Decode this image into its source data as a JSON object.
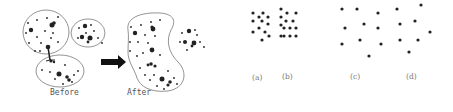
{
  "left_panel": {
    "before_label": "Before",
    "after_label": "After",
    "arrow": "right-arrow"
  },
  "right_panel": {
    "labels": [
      "(a)",
      "(b)",
      "(c)",
      "(d)"
    ]
  },
  "colors": {
    "dots": "#222222",
    "outline": "#777777",
    "arrow": "#111111",
    "text": "#555555"
  }
}
